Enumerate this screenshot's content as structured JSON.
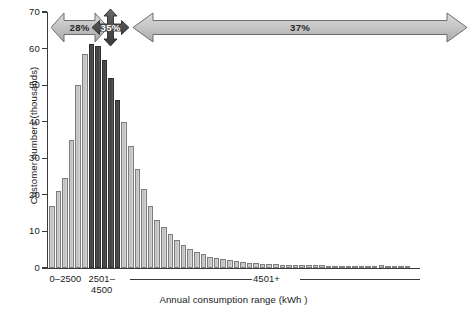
{
  "chart_data": {
    "type": "bar",
    "title": "",
    "subtitle": "",
    "xlabel": "Annual consumption range (kWh )",
    "ylabel": "Customer numbers (thousands)",
    "ylim": [
      0,
      70
    ],
    "yticks": [
      0,
      10,
      20,
      30,
      40,
      50,
      60,
      70
    ],
    "ytick_labels": [
      "0",
      "10",
      "20",
      "30",
      "40",
      "50",
      "60",
      "70"
    ],
    "grid": false,
    "legend": null,
    "category_axis_labels": [
      "0–2500",
      "2501–\n4500",
      "4501+"
    ],
    "bar_count": 55,
    "highlight_color": "#3d3d3d",
    "base_color": "#c6c6c6",
    "values": [
      17,
      21,
      24.5,
      35,
      50,
      58.5,
      61.2,
      60.8,
      57,
      52,
      46,
      39.8,
      33.3,
      27,
      21.7,
      17,
      13.2,
      11.2,
      9.2,
      7.6,
      6.2,
      5.2,
      4.3,
      3.7,
      3.1,
      2.7,
      2.4,
      2.1,
      1.9,
      1.7,
      1.5,
      1.35,
      1.2,
      1.1,
      1.0,
      0.95,
      0.9,
      0.85,
      0.8,
      0.78,
      0.74,
      0.7,
      0.68,
      0.65,
      0.62,
      0.6,
      0.58,
      0.56,
      0.54,
      0.52,
      0.8,
      0.5,
      0.48,
      0.46,
      0.44
    ],
    "highlighted_indices": [
      6,
      7,
      8,
      9,
      10
    ],
    "annotations": [
      {
        "label": "28%",
        "style": "double-arrow-light",
        "span": "0–2500"
      },
      {
        "label": "35%",
        "style": "four-way-arrow-dark",
        "span": "2501–4500"
      },
      {
        "label": "37%",
        "style": "double-arrow-light",
        "span": "4501+"
      }
    ]
  },
  "axes": {
    "y_title": "Customer numbers (thousands)",
    "x_title": "Annual consumption range (kWh )"
  }
}
